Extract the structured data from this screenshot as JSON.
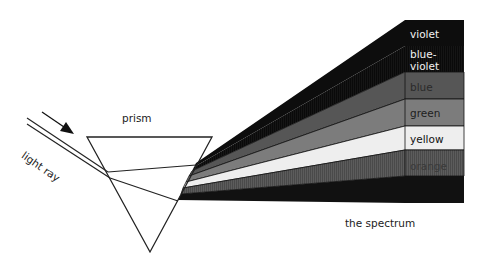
{
  "diagram": {
    "labels": {
      "prism": "prism",
      "light_ray": "light ray",
      "spectrum": "the spectrum"
    },
    "bands": [
      {
        "name": "violet",
        "label": "violet",
        "color": "#0d0d0d",
        "text_color": "#f2f2f2"
      },
      {
        "name": "blue-violet",
        "label_line1": "blue-",
        "label_line2": "violet",
        "color": "#151515",
        "text_color": "#f2f2f2"
      },
      {
        "name": "blue",
        "label": "blue",
        "color": "#565656",
        "text_color": "#2a2a2a"
      },
      {
        "name": "green",
        "label": "green",
        "color": "#7c7c7c",
        "text_color": "#1e1e1e"
      },
      {
        "name": "yellow",
        "label": "yellow",
        "color": "#eeeeee",
        "text_color": "#111111"
      },
      {
        "name": "orange",
        "label": "orange",
        "color": "#5c5c5c",
        "text_color": "#3a3a3a"
      },
      {
        "name": "red",
        "label": "",
        "color": "#111111",
        "text_color": "#ffffff"
      }
    ],
    "icons": {
      "arrow": "arrow-down-right"
    }
  }
}
